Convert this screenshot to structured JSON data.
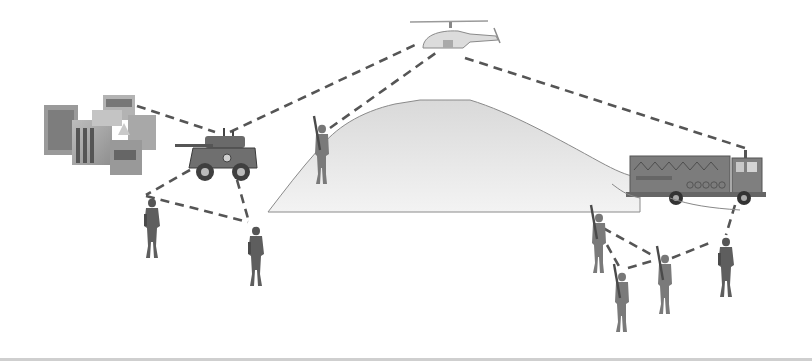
{
  "scene": {
    "description": "Tactical network diagram: helicopter, armored vehicle, buildings, hill, truck and soldiers linked by dashed communication lines",
    "colors": {
      "background": "#ffffff",
      "link": "#555555",
      "hill_fill_top": "#d9d9d9",
      "hill_fill_bottom": "#f2f2f2",
      "hill_outline": "#8a8a8a",
      "figure": "#6e6e6e",
      "figure_dark": "#4a4a4a"
    }
  },
  "nodes": [
    {
      "id": "helicopter",
      "label": "helicopter",
      "x": 455,
      "y": 35
    },
    {
      "id": "buildings",
      "label": "buildings",
      "x": 95,
      "y": 130
    },
    {
      "id": "armored-vehicle",
      "label": "armored vehicle",
      "x": 215,
      "y": 155
    },
    {
      "id": "soldier-hill",
      "label": "soldier on hill",
      "x": 320,
      "y": 155
    },
    {
      "id": "truck",
      "label": "truck",
      "x": 700,
      "y": 180
    },
    {
      "id": "soldier-left-1",
      "label": "soldier",
      "x": 152,
      "y": 228
    },
    {
      "id": "soldier-left-2",
      "label": "soldier",
      "x": 256,
      "y": 255
    },
    {
      "id": "soldier-right-1",
      "label": "soldier",
      "x": 598,
      "y": 245
    },
    {
      "id": "soldier-right-2",
      "label": "soldier",
      "x": 621,
      "y": 300
    },
    {
      "id": "soldier-right-3",
      "label": "soldier",
      "x": 664,
      "y": 282
    },
    {
      "id": "soldier-right-4",
      "label": "soldier",
      "x": 725,
      "y": 262
    }
  ],
  "links": [
    {
      "from": "buildings",
      "to": "armored-vehicle",
      "x1": 137,
      "y1": 106,
      "x2": 215,
      "y2": 132
    },
    {
      "from": "armored-vehicle",
      "to": "helicopter",
      "x1": 230,
      "y1": 132,
      "x2": 415,
      "y2": 45
    },
    {
      "from": "soldier-hill",
      "to": "helicopter",
      "x1": 330,
      "y1": 128,
      "x2": 440,
      "y2": 50
    },
    {
      "from": "helicopter",
      "to": "truck",
      "x1": 465,
      "y1": 58,
      "x2": 745,
      "y2": 148
    },
    {
      "from": "armored-vehicle",
      "to": "soldier-left-1",
      "x1": 190,
      "y1": 170,
      "x2": 146,
      "y2": 195
    },
    {
      "from": "soldier-left-1",
      "to": "soldier-left-2",
      "x1": 146,
      "y1": 196,
      "x2": 248,
      "y2": 222
    },
    {
      "from": "armored-vehicle",
      "to": "soldier-left-2",
      "x1": 237,
      "y1": 180,
      "x2": 249,
      "y2": 222
    },
    {
      "from": "truck",
      "to": "soldier-right-4",
      "x1": 735,
      "y1": 205,
      "x2": 726,
      "y2": 235
    },
    {
      "from": "soldier-right-1",
      "to": "soldier-right-3",
      "x1": 603,
      "y1": 228,
      "x2": 652,
      "y2": 255
    },
    {
      "from": "soldier-right-1",
      "to": "soldier-right-2",
      "x1": 607,
      "y1": 245,
      "x2": 620,
      "y2": 268
    },
    {
      "from": "soldier-right-2",
      "to": "soldier-right-3",
      "x1": 628,
      "y1": 268,
      "x2": 652,
      "y2": 261
    },
    {
      "from": "soldier-right-3",
      "to": "soldier-right-4",
      "x1": 672,
      "y1": 258,
      "x2": 712,
      "y2": 242
    }
  ]
}
